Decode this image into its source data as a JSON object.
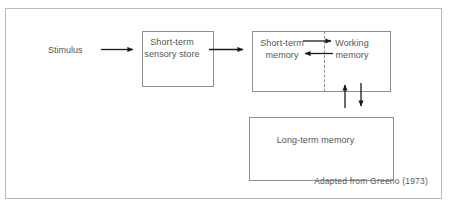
{
  "figure": {
    "caption": "Adapted from Greeno (1973)",
    "frame_border_color": "#b9b9b9",
    "box_border_color": "#8e8e8e",
    "text_color": "#555555",
    "arrow_color": "#1a1a1a",
    "background": "#ffffff"
  },
  "labels": {
    "stimulus": "Stimulus",
    "sensory_store": "Short-term\nsensory store",
    "short_term_memory": "Short-term\nmemory",
    "working_memory": "Working\nmemory",
    "long_term_memory": "Long-term memory"
  },
  "nodes": [
    {
      "id": "stimulus",
      "label": "Stimulus",
      "type": "text"
    },
    {
      "id": "sensory-store",
      "label": "Short-term sensory store",
      "type": "box"
    },
    {
      "id": "short-term-memory",
      "label": "Short-term memory",
      "type": "box-half"
    },
    {
      "id": "working-memory",
      "label": "Working memory",
      "type": "box-half"
    },
    {
      "id": "long-term-memory",
      "label": "Long-term memory",
      "type": "box"
    }
  ],
  "edges": [
    {
      "from": "stimulus",
      "to": "sensory-store",
      "direction": "right"
    },
    {
      "from": "sensory-store",
      "to": "short-term-memory",
      "direction": "right"
    },
    {
      "from": "short-term-memory",
      "to": "working-memory",
      "direction": "right"
    },
    {
      "from": "working-memory",
      "to": "short-term-memory",
      "direction": "left"
    },
    {
      "from": "long-term-memory",
      "to": "working-memory",
      "direction": "up"
    },
    {
      "from": "working-memory",
      "to": "long-term-memory",
      "direction": "down"
    }
  ]
}
